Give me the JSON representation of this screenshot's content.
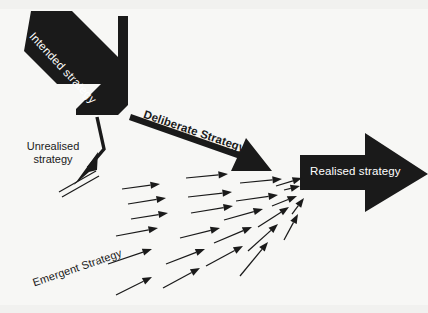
{
  "diagram": {
    "background_color": "#f7f7f5",
    "ink_color": "#1a1a1a",
    "label_on_dark_color": "#ffffff",
    "labels": {
      "intended": "Intended strategy",
      "deliberate": "Deliberate Strategy",
      "unrealised": "Unrealised\nstrategy",
      "emergent": "Emergent Strategy",
      "realised": "Realised strategy"
    },
    "elements": [
      {
        "name": "intended-strategy-arrow",
        "label": "Intended strategy",
        "shape": "thick-chevron-block-arrow",
        "direction": "down-right",
        "fill": "#1a1a1a",
        "label_color": "#ffffff"
      },
      {
        "name": "deliberate-strategy-arrow",
        "label": "Deliberate Strategy",
        "shape": "tapered-solid-arrow",
        "direction": "right-down",
        "fill": "#1a1a1a",
        "label_color": "#1a1a1a"
      },
      {
        "name": "unrealised-strategy-arrow",
        "label": "Unrealised strategy",
        "shape": "bent-arrow-struck-through",
        "direction": "down-left",
        "fill": "#1a1a1a",
        "label_color": "#1a1a1a"
      },
      {
        "name": "emergent-strategy-arrows",
        "label": "Emergent Strategy",
        "shape": "field-of-thin-arrows",
        "direction": "converging-right",
        "count": 25,
        "fill": "#1a1a1a",
        "label_color": "#1a1a1a"
      },
      {
        "name": "realised-strategy-arrow",
        "label": "Realised strategy",
        "shape": "block-arrow",
        "direction": "right",
        "fill": "#1a1a1a",
        "label_color": "#ffffff"
      }
    ],
    "emergent_arrows": [
      {
        "x1": 122,
        "y1": 189,
        "x2": 160,
        "y2": 184
      },
      {
        "x1": 128,
        "y1": 204,
        "x2": 166,
        "y2": 198
      },
      {
        "x1": 131,
        "y1": 219,
        "x2": 168,
        "y2": 213
      },
      {
        "x1": 116,
        "y1": 236,
        "x2": 158,
        "y2": 228
      },
      {
        "x1": 108,
        "y1": 264,
        "x2": 152,
        "y2": 249
      },
      {
        "x1": 116,
        "y1": 295,
        "x2": 152,
        "y2": 277
      },
      {
        "x1": 186,
        "y1": 178,
        "x2": 228,
        "y2": 174
      },
      {
        "x1": 188,
        "y1": 197,
        "x2": 232,
        "y2": 192
      },
      {
        "x1": 191,
        "y1": 213,
        "x2": 233,
        "y2": 206
      },
      {
        "x1": 180,
        "y1": 238,
        "x2": 220,
        "y2": 228
      },
      {
        "x1": 166,
        "y1": 264,
        "x2": 205,
        "y2": 249
      },
      {
        "x1": 163,
        "y1": 288,
        "x2": 200,
        "y2": 268
      },
      {
        "x1": 240,
        "y1": 183,
        "x2": 282,
        "y2": 179
      },
      {
        "x1": 236,
        "y1": 201,
        "x2": 278,
        "y2": 195
      },
      {
        "x1": 224,
        "y1": 220,
        "x2": 263,
        "y2": 209
      },
      {
        "x1": 214,
        "y1": 243,
        "x2": 252,
        "y2": 227
      },
      {
        "x1": 206,
        "y1": 266,
        "x2": 243,
        "y2": 246
      },
      {
        "x1": 284,
        "y1": 190,
        "x2": 300,
        "y2": 186
      },
      {
        "x1": 272,
        "y1": 206,
        "x2": 297,
        "y2": 196
      },
      {
        "x1": 258,
        "y1": 227,
        "x2": 289,
        "y2": 207
      },
      {
        "x1": 248,
        "y1": 251,
        "x2": 278,
        "y2": 224
      },
      {
        "x1": 240,
        "y1": 276,
        "x2": 268,
        "y2": 242
      },
      {
        "x1": 276,
        "y1": 186,
        "x2": 302,
        "y2": 178
      },
      {
        "x1": 292,
        "y1": 214,
        "x2": 304,
        "y2": 198
      },
      {
        "x1": 284,
        "y1": 240,
        "x2": 298,
        "y2": 214
      }
    ]
  }
}
